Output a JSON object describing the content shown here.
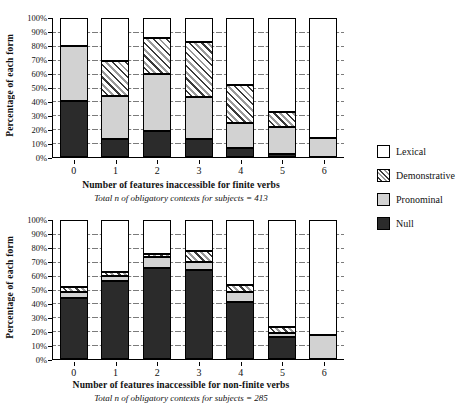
{
  "figure": {
    "ylabel": "Percentage of each form",
    "ytick_labels": [
      "100%",
      "90%",
      "80%",
      "70%",
      "60%",
      "50%",
      "40%",
      "30%",
      "20%",
      "10%",
      "0%"
    ],
    "legend": [
      {
        "key": "lexical",
        "label": "Lexical",
        "swatch": "lex"
      },
      {
        "key": "demonstrative",
        "label": "Demonstrative",
        "swatch": "demo"
      },
      {
        "key": "pronominal",
        "label": "Pronominal",
        "swatch": "pron"
      },
      {
        "key": "null",
        "label": "Null",
        "swatch": "null"
      }
    ]
  },
  "chart_data": [
    {
      "id": "finite",
      "type": "bar",
      "stacked": true,
      "title": "Number of features inaccessible for finite verbs",
      "subtitle": "Total n of obligatory contexts for subjects = 413",
      "xlabel": "Number of features inaccessible for finite verbs",
      "ylabel": "Percentage of each form",
      "ylim": [
        0,
        100
      ],
      "ytick_labels": [
        "0%",
        "10%",
        "20%",
        "30%",
        "40%",
        "50%",
        "60%",
        "70%",
        "80%",
        "90%",
        "100%"
      ],
      "grid": "dashed-horizontal",
      "legend_position": "right",
      "categories": [
        "0",
        "1",
        "2",
        "3",
        "4",
        "5",
        "6"
      ],
      "series": [
        {
          "name": "Null",
          "values": [
            40.0,
            12.5,
            18.5,
            12.5,
            6.0,
            1.5,
            0.0
          ]
        },
        {
          "name": "Pronominal",
          "values": [
            40.5,
            31.0,
            41.5,
            30.5,
            18.0,
            20.0,
            13.5
          ]
        },
        {
          "name": "Demonstrative",
          "values": [
            0.0,
            25.5,
            26.5,
            40.0,
            27.5,
            10.5,
            0.0
          ]
        },
        {
          "name": "Lexical",
          "values": [
            19.5,
            31.0,
            13.5,
            17.0,
            48.5,
            68.0,
            86.5
          ]
        }
      ],
      "cumulative_tops": {
        "Null": [
          40.0,
          12.5,
          18.5,
          12.5,
          6.0,
          1.5,
          0.0
        ],
        "Pronominal": [
          80.5,
          43.5,
          60.0,
          43.0,
          24.0,
          21.5,
          13.5
        ],
        "Demonstrative": [
          80.5,
          69.0,
          86.5,
          83.0,
          51.5,
          32.0,
          13.5
        ],
        "Lexical": [
          100,
          100,
          100,
          100,
          100,
          100,
          100
        ]
      }
    },
    {
      "id": "nonfinite",
      "type": "bar",
      "stacked": true,
      "title": "Number of features inaccessible for non-finite verbs",
      "subtitle": "Total n of obligatory contexts for subjects = 285",
      "xlabel": "Number of features inaccessible for non-finite verbs",
      "ylabel": "Percentage of each form",
      "ylim": [
        0,
        100
      ],
      "ytick_labels": [
        "0%",
        "10%",
        "20%",
        "30%",
        "40%",
        "50%",
        "60%",
        "70%",
        "80%",
        "90%",
        "100%"
      ],
      "grid": "dashed-horizontal",
      "legend_position": "right",
      "categories": [
        "0",
        "1",
        "2",
        "3",
        "4",
        "5",
        "6"
      ],
      "series": [
        {
          "name": "Null",
          "values": [
            44.0,
            56.0,
            66.0,
            64.5,
            41.0,
            15.0,
            0.0
          ]
        },
        {
          "name": "Pronominal",
          "values": [
            4.0,
            4.0,
            8.0,
            5.5,
            7.0,
            3.0,
            16.5
          ]
        },
        {
          "name": "Demonstrative",
          "values": [
            4.0,
            2.5,
            2.0,
            8.0,
            5.0,
            5.0,
            0.0
          ]
        },
        {
          "name": "Lexical",
          "values": [
            48.0,
            37.5,
            24.0,
            22.0,
            47.0,
            77.0,
            83.5
          ]
        }
      ],
      "cumulative_tops": {
        "Null": [
          44.0,
          56.0,
          66.0,
          64.5,
          41.0,
          15.0,
          0.0
        ],
        "Pronominal": [
          48.0,
          60.0,
          74.0,
          70.0,
          48.0,
          18.0,
          16.5
        ],
        "Demonstrative": [
          52.0,
          62.5,
          76.0,
          78.0,
          53.0,
          23.0,
          16.5
        ],
        "Lexical": [
          100,
          100,
          100,
          100,
          100,
          100,
          100
        ]
      }
    }
  ]
}
